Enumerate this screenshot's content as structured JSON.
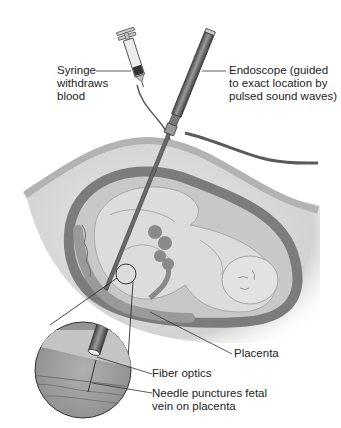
{
  "diagram": {
    "title": "",
    "labels": {
      "syringe": "Syringe\nwithdraws\nblood",
      "endoscope": "Endoscope (guided\nto exact location by\npulsed sound waves)",
      "placenta": "Placenta",
      "fiber_optics": "Fiber optics",
      "needle": "Needle punctures fetal\nvein on placenta"
    },
    "components": [
      "syringe",
      "tubing",
      "endoscope",
      "abdominal-wall",
      "uterus",
      "fetus",
      "umbilical-cord",
      "placenta",
      "magnified-inset",
      "fiber-optics",
      "needle",
      "fetal-vein"
    ],
    "colors": {
      "background": "#ffffff",
      "line": "#333333",
      "skin": "#b8b8b8",
      "uterus_wall": "#7a7a7a",
      "fetus": "#d6d6d6",
      "amniotic": "#c4c4c4",
      "placenta": "#8e8e8e",
      "instrument": "#6a6a6a"
    }
  }
}
